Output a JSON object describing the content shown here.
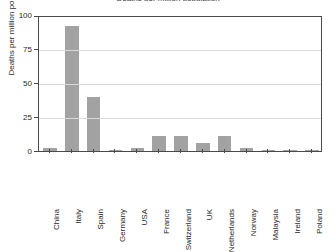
{
  "chart_data": {
    "type": "bar",
    "title": "Deaths per million population",
    "xlabel": "",
    "ylabel": "Deaths per million population",
    "categories": [
      "China",
      "Italy",
      "Spain",
      "Germany",
      "USA",
      "France",
      "Switzerland",
      "UK",
      "Netherlands",
      "Norway",
      "Malaysia",
      "Ireland",
      "Poland"
    ],
    "values": [
      2,
      92,
      40,
      1,
      2,
      11,
      11,
      6,
      11,
      2,
      0.3,
      0.3,
      0.3
    ],
    "ylim": [
      0,
      100
    ],
    "yticks": [
      0,
      25,
      50,
      75,
      100
    ],
    "ytick_labels": [
      "0",
      "25",
      "50",
      "75",
      "100"
    ],
    "grid": true,
    "legend": "none",
    "series_color": "#a2a2a2",
    "axis_color": "#4a4a4a",
    "grid_color": "#d9d9d9"
  }
}
